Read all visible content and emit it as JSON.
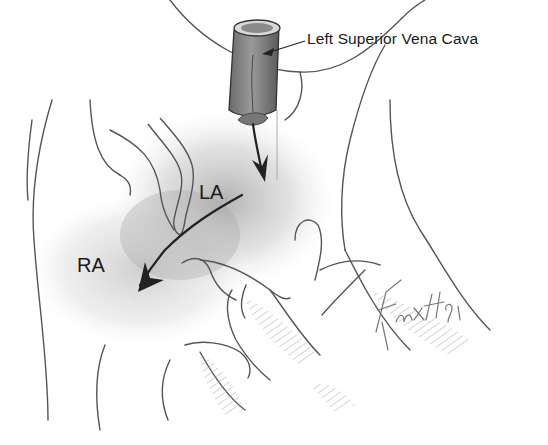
{
  "figure": {
    "labels": {
      "lsvc": "Left Superior Vena Cava",
      "la": "LA",
      "ra": "RA"
    },
    "signature": "Fuxx#91",
    "colors": {
      "line": "#555555",
      "shading": "#b8b8b8",
      "arrow": "#222222",
      "background": "#ffffff"
    }
  }
}
